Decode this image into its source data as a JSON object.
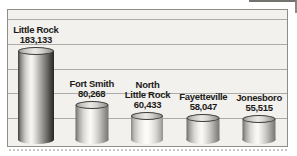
{
  "chart_data": {
    "type": "bar",
    "title": "",
    "subtitle": "",
    "unit": "population",
    "categories": [
      "Little Rock",
      "Fort Smith",
      "North Little Rock",
      "Fayetteville",
      "Jonesboro"
    ],
    "values": [
      183133,
      80268,
      60433,
      58047,
      55515
    ],
    "value_labels": [
      "183,133",
      "80,268",
      "60,433",
      "58,047",
      "55,515"
    ],
    "bars": [
      {
        "city": "Little Rock",
        "value_label": "183,133",
        "value": 183133
      },
      {
        "city": "Fort Smith",
        "value_label": "80,268",
        "value": 80268
      },
      {
        "city": "North\nLittle Rock",
        "value_label": "60,433",
        "value": 60433
      },
      {
        "city": "Fayetteville",
        "value_label": "58,047",
        "value": 58047
      },
      {
        "city": "Jonesboro",
        "value_label": "55,515",
        "value": 55515
      }
    ],
    "grid": "horizontal gridlines, unlabeled",
    "axes": "no axis tick labels visible",
    "legend": "none",
    "bar_style": "3D metallic cylinders"
  },
  "colors": {
    "plot_background": "#f2f1ee",
    "gridline": "#adaba6",
    "frame_border": "#8e8c88",
    "label_text": "#1c1b19",
    "page_background": "#ffffff"
  }
}
